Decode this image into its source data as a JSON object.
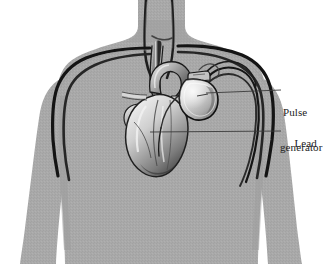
{
  "figure": {
    "alt": "Grey human torso silhouette showing heart, great vessels, an implanted pulse generator below the left collarbone and pacing leads running into the heart"
  },
  "callouts": [
    {
      "id": "pulse-generator",
      "line1": "Pulse",
      "line2": "generator",
      "full_text": "Pulse generator",
      "leader": {
        "x1": 206,
        "y1": 92,
        "x2": 281,
        "y2": 92
      },
      "target": "implanted-device"
    },
    {
      "id": "lead",
      "line1": "Lead",
      "line2": "",
      "full_text": "Lead",
      "leader": {
        "x1": 150,
        "y1": 131,
        "x2": 281,
        "y2": 131
      },
      "target": "pacing-lead-wire"
    }
  ],
  "colors": {
    "background": "#ffffff",
    "body_fill": "#a9a9a9",
    "body_fill_shadow": "#9a9a9a",
    "body_edge": "#8f8f8f",
    "vessel_dark": "#1d1d1d",
    "vessel_mid": "#4a4a4a",
    "heart_light": "#d8d8d8",
    "heart_mid": "#9d9d9d",
    "heart_dark": "#3a3a3a",
    "device_body": "#cfcfcf",
    "device_edge": "#141414",
    "leader_line": "#3a3a3a",
    "label_text": "#222222"
  },
  "parts": {
    "torso": "human-torso-silhouette",
    "neck": "neck",
    "left_arm": "arm-left",
    "right_arm": "arm-right",
    "heart": "heart",
    "aortic_arch": "aortic-arch",
    "superior_vena_cava": "superior-vena-cava",
    "carotid_vessels": "carotid-vessels",
    "subclavian_left": "subclavian-vessel-left",
    "subclavian_right": "subclavian-vessel-right",
    "pulse_generator": "pulse-generator-device",
    "device_header": "device-connector-header",
    "lead_atrial": "pacing-lead-atrial",
    "lead_ventricular": "pacing-lead-ventricular"
  }
}
